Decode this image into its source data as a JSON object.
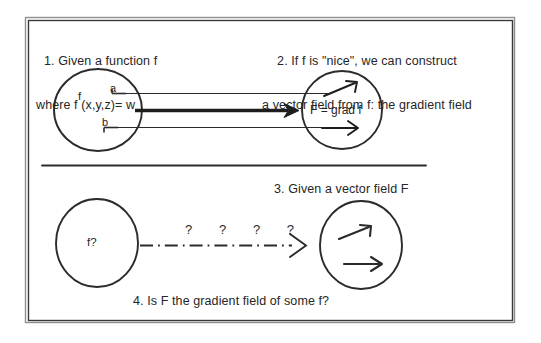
{
  "document": {
    "kind": "hand-drawn-math-slide",
    "background_color": "#ffffff",
    "ink_color": "#262626"
  },
  "frame": {
    "name": "outer-slide-border",
    "x": 24,
    "y": 16,
    "width": 492,
    "height": 308
  },
  "panels": {
    "top_left": {
      "caption_line1": "1. Given a function f",
      "caption_line2": "where f (x,y,z)= w",
      "circle_label": "f",
      "point_a_label": "a",
      "point_b_label": "b"
    },
    "top_right": {
      "caption_line1": "2. If f is \"nice\", we can construct",
      "caption_line2": "a vector field from f: the gradient field",
      "circle_label": "F = grad f"
    },
    "bottom_left": {
      "circle_label": "f?"
    },
    "bottom_right": {
      "caption": "3. Given a vector field F"
    },
    "bottom_caption": "4. Is F the gradient field of some f?"
  },
  "connectors": {
    "top_arrow": {
      "name": "solid-thick-arrow",
      "style": "solid",
      "direction": "left-to-right"
    },
    "bottom_arrow": {
      "name": "dash-dot-question-arrow",
      "style": "dash-dot",
      "direction": "left-to-right",
      "annotation": "?  ?  ?  ?"
    }
  },
  "divider": {
    "name": "horizontal-rule",
    "x1": 42,
    "x2": 426,
    "y": 165
  }
}
